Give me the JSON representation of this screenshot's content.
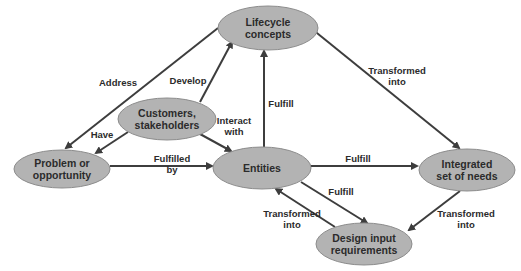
{
  "diagram": {
    "type": "concept-relationship-diagram",
    "colors": {
      "node_fill": "#b3b3b3",
      "node_stroke": "#8c8c8c",
      "edge": "#3d3d3d",
      "text": "#2b2b2b",
      "background": "#ffffff"
    },
    "nodes": [
      {
        "id": "lifecycle",
        "lines": [
          "Lifecycle",
          "concepts"
        ],
        "cx": 268,
        "cy": 28,
        "rx": 50,
        "ry": 22
      },
      {
        "id": "customers",
        "lines": [
          "Customers,",
          "stakeholders"
        ],
        "cx": 167,
        "cy": 119,
        "rx": 49,
        "ry": 21
      },
      {
        "id": "problem",
        "lines": [
          "Problem or",
          "opportunity"
        ],
        "cx": 62,
        "cy": 169,
        "rx": 48,
        "ry": 19
      },
      {
        "id": "entities",
        "lines": [
          "Entities"
        ],
        "cx": 262,
        "cy": 168,
        "rx": 49,
        "ry": 21
      },
      {
        "id": "needs",
        "lines": [
          "Integrated",
          "set of needs"
        ],
        "cx": 467,
        "cy": 170,
        "rx": 48,
        "ry": 21
      },
      {
        "id": "design",
        "lines": [
          "Design input",
          "requirements"
        ],
        "cx": 364,
        "cy": 244,
        "rx": 48,
        "ry": 21
      }
    ],
    "edges": [
      {
        "from": "lifecycle",
        "to": "problem",
        "label": [
          "Address"
        ],
        "x1": 218,
        "y1": 28,
        "x2": 66,
        "y2": 148,
        "lx": 118,
        "ly": 86
      },
      {
        "from": "customers",
        "to": "lifecycle",
        "label": [
          "Develop"
        ],
        "x1": 200,
        "y1": 102,
        "x2": 232,
        "y2": 42,
        "lx": 188,
        "ly": 84
      },
      {
        "from": "customers",
        "to": "problem",
        "label": [
          "Have"
        ],
        "x1": 128,
        "y1": 132,
        "x2": 96,
        "y2": 153,
        "lx": 102,
        "ly": 138
      },
      {
        "from": "customers",
        "to": "entities",
        "label": [
          "Interact",
          "with"
        ],
        "x1": 200,
        "y1": 134,
        "x2": 231,
        "y2": 151,
        "lx": 234,
        "ly": 124
      },
      {
        "from": "problem",
        "to": "entities",
        "label": [
          "Fulfilled",
          "by"
        ],
        "x1": 110,
        "y1": 166,
        "x2": 212,
        "y2": 166,
        "lx": 172,
        "ly": 162
      },
      {
        "from": "entities",
        "to": "lifecycle",
        "label": [
          "Fulfill"
        ],
        "x1": 264,
        "y1": 147,
        "x2": 264,
        "y2": 51,
        "lx": 281,
        "ly": 107
      },
      {
        "from": "lifecycle",
        "to": "needs",
        "label": [
          "Transformed",
          "into"
        ],
        "x1": 312,
        "y1": 29,
        "x2": 459,
        "y2": 148,
        "lx": 397,
        "ly": 74
      },
      {
        "from": "entities",
        "to": "needs",
        "label": [
          "Fulfill"
        ],
        "x1": 311,
        "y1": 166,
        "x2": 417,
        "y2": 166,
        "lx": 358,
        "ly": 162
      },
      {
        "from": "entities",
        "to": "design",
        "label": [
          "Fulfill"
        ],
        "x1": 301,
        "y1": 182,
        "x2": 367,
        "y2": 223,
        "lx": 341,
        "ly": 195
      },
      {
        "from": "design",
        "to": "entities",
        "label": [
          "Transformed",
          "into"
        ],
        "x1": 335,
        "y1": 227,
        "x2": 276,
        "y2": 189,
        "lx": 292,
        "ly": 217
      },
      {
        "from": "needs",
        "to": "design",
        "label": [
          "Transformed",
          "into"
        ],
        "x1": 460,
        "y1": 191,
        "x2": 409,
        "y2": 230,
        "lx": 466,
        "ly": 217
      }
    ]
  }
}
